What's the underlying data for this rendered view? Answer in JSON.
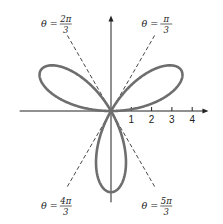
{
  "chart_data": {
    "type": "line",
    "subtype": "polar-curve",
    "title": "",
    "equation": "r = 4 sin 3θ",
    "curve": {
      "function": "r = a*sin(3*theta)",
      "a": 4,
      "petals": 3,
      "theta_range": [
        0,
        3.14159265
      ],
      "petal_axes_deg": [
        30,
        150,
        270
      ],
      "color": "#6e6e6e"
    },
    "x_axis": {
      "ticks": [
        1,
        2,
        3,
        4
      ],
      "tick_labels": [
        "1",
        "2",
        "3",
        "4"
      ],
      "range": [
        -4.5,
        4.8
      ],
      "arrow": true
    },
    "y_axis": {
      "ticks": [],
      "range": [
        -4.5,
        4.7
      ],
      "arrow": true
    },
    "reference_lines": [
      {
        "name": "theta-2pi-3",
        "theta_num": "2π",
        "theta_den": "3",
        "angle_deg": 120,
        "position": "top-left"
      },
      {
        "name": "theta-pi-3",
        "theta_num": "π",
        "theta_den": "3",
        "angle_deg": 60,
        "position": "top-right"
      },
      {
        "name": "theta-4pi-3",
        "theta_num": "4π",
        "theta_den": "3",
        "angle_deg": 240,
        "position": "bottom-left"
      },
      {
        "name": "theta-5pi-3",
        "theta_num": "5π",
        "theta_den": "3",
        "angle_deg": 300,
        "position": "bottom-right"
      }
    ],
    "label_prefix": "θ =",
    "grid": false,
    "legend": "none"
  }
}
